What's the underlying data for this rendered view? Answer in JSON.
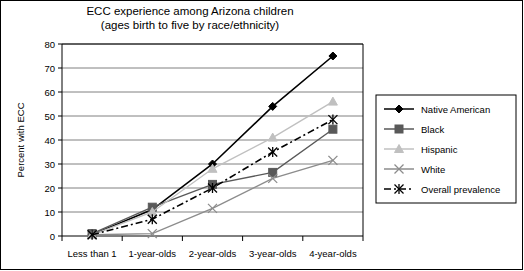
{
  "figure": {
    "title_line1": "ECC experience among Arizona children",
    "title_line2": "(ages birth to five by race/ethnicity)",
    "ylabel": "Percent with ECC"
  },
  "axis": {
    "y_ticks": [
      "0",
      "10",
      "20",
      "30",
      "40",
      "50",
      "60",
      "70",
      "80"
    ],
    "x_categories": [
      "Less than 1",
      "1-year-olds",
      "2-year-olds",
      "3-year-olds",
      "4-year-olds"
    ]
  },
  "legend": {
    "items": [
      {
        "label": "Native American",
        "marker": "diamond-marker",
        "color": "#000000",
        "dash": "solid"
      },
      {
        "label": "Black",
        "marker": "square-marker",
        "color": "#595959",
        "dash": "solid"
      },
      {
        "label": "Hispanic",
        "marker": "triangle-marker",
        "color": "#c0c0c0",
        "dash": "solid"
      },
      {
        "label": "White",
        "marker": "x-marker",
        "color": "#8c8c8c",
        "dash": "solid"
      },
      {
        "label": "Overall prevalence",
        "marker": "asterisk-marker",
        "color": "#000000",
        "dash": "dashdot"
      }
    ]
  },
  "chart_data": {
    "type": "line",
    "title": "ECC experience among Arizona children (ages birth to five by race/ethnicity)",
    "xlabel": "",
    "ylabel": "Percent with ECC",
    "categories": [
      "Less than 1",
      "1-year-olds",
      "2-year-olds",
      "3-year-olds",
      "4-year-olds"
    ],
    "ylim": [
      0,
      80
    ],
    "ytick_step": 10,
    "grid": true,
    "legend_position": "right",
    "series": [
      {
        "name": "Native American",
        "values": [
          0.5,
          11,
          30,
          54,
          75
        ],
        "color": "#000000",
        "marker": "diamond",
        "dash": "solid"
      },
      {
        "name": "Black",
        "values": [
          1,
          12,
          21.5,
          26.5,
          44.5
        ],
        "color": "#595959",
        "marker": "square",
        "dash": "solid"
      },
      {
        "name": "Hispanic",
        "values": [
          0.5,
          10,
          28,
          41,
          56
        ],
        "color": "#c0c0c0",
        "marker": "triangle",
        "dash": "solid"
      },
      {
        "name": "White",
        "values": [
          0.5,
          1,
          11.5,
          24,
          31.5
        ],
        "color": "#8c8c8c",
        "marker": "x",
        "dash": "solid"
      },
      {
        "name": "Overall prevalence",
        "values": [
          0.5,
          7,
          20,
          35,
          48.5
        ],
        "color": "#000000",
        "marker": "asterisk",
        "dash": "dashdot"
      }
    ]
  }
}
